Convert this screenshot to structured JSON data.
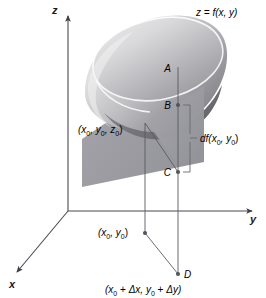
{
  "figure": {
    "surface_label": "z = f(x,  y)",
    "axes": {
      "x": "x",
      "y": "y",
      "z": "z"
    },
    "points": {
      "a": "A",
      "b": "B",
      "c": "C",
      "d": "D"
    },
    "labels": {
      "tangent_point": "(x0, y0, z0)",
      "tangent_point_parts": {
        "open": "(x",
        "sub1": "0",
        "mid1": ",  y",
        "sub2": "0",
        "mid2": ",  z",
        "sub3": "0",
        "close": ")"
      },
      "base_point_parts": {
        "open": "(x",
        "sub1": "0",
        "mid1": ",  y",
        "sub2": "0",
        "close": ")"
      },
      "increment_point_parts": {
        "open": "(x",
        "sub1": "0",
        "mid1": " + ",
        "delta1": "Δx,  ",
        "y": "y",
        "sub2": "0",
        "mid2": " + ",
        "delta2": "Δy)"
      },
      "differential_parts": {
        "df": "df",
        "open": "(x",
        "sub1": "0",
        "mid": ",  y",
        "sub2": "0",
        "close": ")"
      }
    },
    "colors": {
      "background": "#ffffff",
      "axis": "#4a4a52",
      "plane_fill": "#9a9aa0",
      "bowl_outer_light": "#e8e8e8",
      "bowl_outer_dark": "#6f6f74",
      "bowl_inner_light": "#f2f2f2",
      "rim": "#ffffff",
      "text": "#000000"
    }
  }
}
